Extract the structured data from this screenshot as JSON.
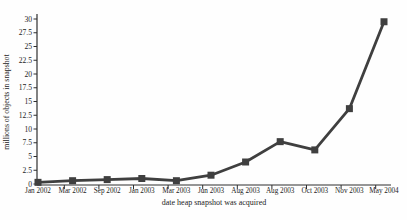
{
  "chart_data": {
    "type": "line",
    "title": "",
    "xlabel": "date heap snapshot was acquired",
    "ylabel": "millions of objects in snapshot",
    "categories": [
      "Jan 2002",
      "Mar 2002",
      "Sep 2002",
      "Jan 2003",
      "Mar 2003",
      "Jun 2003",
      "Aug 2003",
      "Aug 2003",
      "Oct 2003",
      "Nov 2003",
      "May 2004"
    ],
    "values": [
      0.3,
      0.6,
      0.8,
      1.0,
      0.6,
      1.6,
      4.0,
      7.7,
      6.2,
      13.7,
      29.5
    ],
    "ylim": [
      0,
      30
    ],
    "ytick_step": 2.5,
    "ytick_labels": [
      "0",
      "2.5",
      "5",
      "7.5",
      "10",
      "12.5",
      "15",
      "17.5",
      "20",
      "22.5",
      "25",
      "27.5",
      "30"
    ],
    "grid": false,
    "legend": "none",
    "marker_shape": "square",
    "series_color": "#3f3f3f",
    "axis_color": "#2e2e2e",
    "text_color": "#1c1c1c",
    "background_color": "#fefefe"
  }
}
